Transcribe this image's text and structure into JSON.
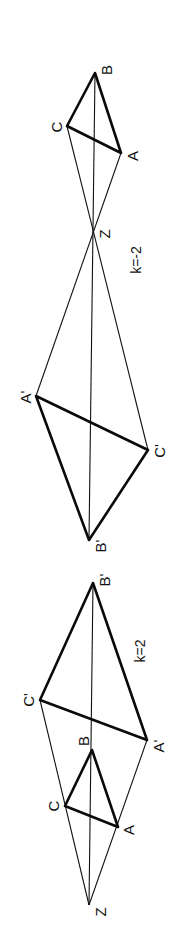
{
  "diagram": {
    "orientation": "rotated 90 degrees clockwise",
    "figures": [
      {
        "id": "negative-scale",
        "scale_label": "k=-2",
        "centre": {
          "name": "Z",
          "x": 93,
          "y": 233
        },
        "original": {
          "A": {
            "name": "A",
            "x": 121,
            "y": 153
          },
          "B": {
            "name": "B",
            "x": 95,
            "y": 73
          },
          "C": {
            "name": "C",
            "x": 67,
            "y": 126
          }
        },
        "image": {
          "A": {
            "name": "A'",
            "x": 36,
            "y": 396
          },
          "B": {
            "name": "B'",
            "x": 89,
            "y": 540
          },
          "C": {
            "name": "C'",
            "x": 148,
            "y": 450
          }
        }
      },
      {
        "id": "positive-scale",
        "scale_label": "k=2",
        "centre": {
          "name": "Z",
          "x": 89,
          "y": 905
        },
        "original": {
          "A": {
            "name": "A",
            "x": 118,
            "y": 827
          },
          "B": {
            "name": "B",
            "x": 92,
            "y": 750
          },
          "C": {
            "name": "C",
            "x": 65,
            "y": 806
          }
        },
        "image": {
          "A": {
            "name": "A'",
            "x": 147,
            "y": 740
          },
          "B": {
            "name": "B'",
            "x": 93,
            "y": 583
          },
          "C": {
            "name": "C'",
            "x": 40,
            "y": 700
          }
        }
      }
    ]
  },
  "labels": {
    "top": {
      "B": "B",
      "C": "C",
      "A": "A",
      "Z": "Z",
      "k": "k=-2",
      "A_prime": "A'",
      "C_prime": "C'",
      "B_prime": "B'"
    },
    "bottom": {
      "B_prime": "B'",
      "C_prime": "C'",
      "A_prime": "A'",
      "k": "k=2",
      "B": "B",
      "C": "C",
      "A": "A",
      "Z": "Z"
    }
  }
}
